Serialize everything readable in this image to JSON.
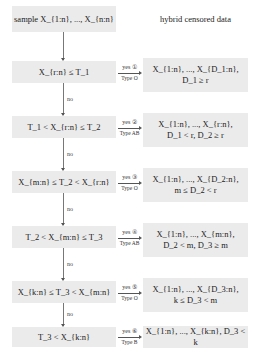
{
  "header": {
    "start": "sample X_{1:n}, ..., X_{n:n}",
    "output_title": "hybrid censored data"
  },
  "no_label": "no",
  "rows": [
    {
      "condition": "X_{r:n} ≤ T_1",
      "yes": "yes ①",
      "type": "Type O",
      "result_line1": "X_{1:n}, ..., X_{D_1:n},",
      "result_line2": "D_1 ≥ r"
    },
    {
      "condition": "T_1 < X_{r:n} ≤ T_2",
      "yes": "yes ②",
      "type": "Type AB",
      "result_line1": "X_{1:n}, ..., X_{r:n},",
      "result_line2": "D_1 < r, D_2 ≥ r"
    },
    {
      "condition": "X_{m:n} ≤ T_2 < X_{r:n}",
      "yes": "yes ③",
      "type": "Type O",
      "result_line1": "X_{1:n}, ..., X_{D_2:n},",
      "result_line2": "m ≤ D_2 < r"
    },
    {
      "condition": "T_2 < X_{m:n} ≤ T_3",
      "yes": "yes ④",
      "type": "Type AB",
      "result_line1": "X_{1:n}, ..., X_{m:n},",
      "result_line2": "D_2 < m, D_3 ≥ m"
    },
    {
      "condition": "X_{k:n} ≤ T_3 < X_{m:n}",
      "yes": "yes ⑤",
      "type": "Type O",
      "result_line1": "X_{1:n}, ..., X_{D_3:n},",
      "result_line2": "k ≤ D_3 < m"
    },
    {
      "condition": "T_3 < X_{k:n}",
      "yes": "yes ⑥",
      "type": "Type B",
      "result_line1": "X_{1:n}, ..., X_{k:n}, D_3 < k",
      "result_line2": ""
    }
  ]
}
